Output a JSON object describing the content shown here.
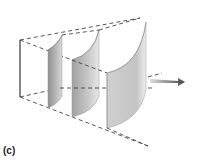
{
  "figure": {
    "label": "(c)",
    "wavefronts": [
      {
        "name": "wavefront-1"
      },
      {
        "name": "wavefront-2"
      },
      {
        "name": "wavefront-3"
      }
    ],
    "colors": {
      "surface_fill": "#c8c8c8",
      "surface_dark": "#9a9a9a",
      "dashed_line": "#444444",
      "arrow": "#555555"
    }
  }
}
